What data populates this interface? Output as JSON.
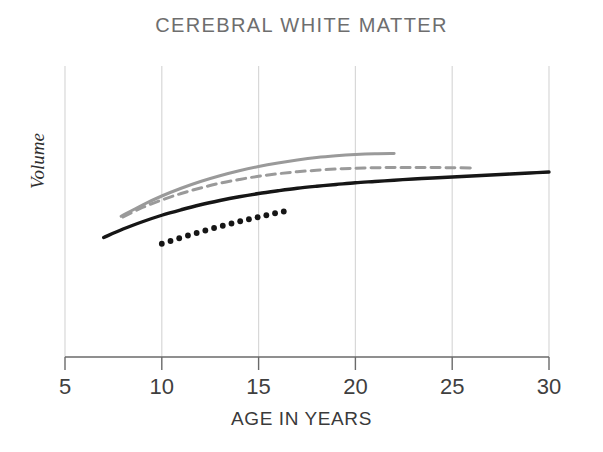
{
  "chart_data": {
    "type": "line",
    "title": "CEREBRAL WHITE MATTER",
    "xlabel": "AGE IN YEARS",
    "ylabel": "Volume",
    "xlim": [
      5,
      30
    ],
    "xticks": [
      5,
      10,
      15,
      20,
      25,
      30
    ],
    "xticklabels": [
      "5",
      "10",
      "15",
      "20",
      "25",
      "30"
    ],
    "ylim": [
      0,
      1
    ],
    "yticks": [],
    "yticklabels": [],
    "grid": "vertical-only",
    "legend": "none",
    "colors": {
      "gray_series": "#9a9a9a",
      "black_series": "#161616",
      "grid": "#d8d8d8",
      "axis": "#6a6a6a",
      "title": "#6e6e6e"
    },
    "series": [
      {
        "name": "gray-solid",
        "style": "solid",
        "color": "#9a9a9a",
        "x": [
          7.9,
          9.0,
          10.0,
          11.0,
          12.0,
          13.0,
          14.0,
          15.0,
          16.0,
          17.0,
          18.0,
          19.0,
          20.0,
          21.0,
          22.0
        ],
        "y": [
          0.455,
          0.5,
          0.536,
          0.567,
          0.594,
          0.617,
          0.637,
          0.654,
          0.668,
          0.68,
          0.69,
          0.697,
          0.702,
          0.705,
          0.706
        ]
      },
      {
        "name": "gray-dashed",
        "style": "dashed",
        "color": "#9a9a9a",
        "x": [
          8.0,
          9.0,
          10.0,
          11.0,
          12.0,
          13.0,
          14.0,
          15.0,
          16.0,
          17.0,
          18.0,
          19.0,
          20.0,
          21.0,
          22.0,
          23.0,
          24.0,
          25.0,
          26.0
        ],
        "y": [
          0.452,
          0.49,
          0.52,
          0.546,
          0.568,
          0.587,
          0.602,
          0.615,
          0.625,
          0.633,
          0.639,
          0.644,
          0.647,
          0.649,
          0.65,
          0.65,
          0.65,
          0.649,
          0.648
        ]
      },
      {
        "name": "black-solid",
        "style": "solid",
        "color": "#161616",
        "x": [
          7.0,
          8.0,
          9.0,
          10.0,
          11.0,
          12.0,
          13.0,
          14.0,
          15.0,
          16.0,
          17.0,
          18.0,
          19.0,
          20.0,
          21.0,
          22.0,
          23.0,
          24.0,
          25.0,
          26.0,
          27.0,
          28.0,
          29.0,
          30.0
        ],
        "y": [
          0.37,
          0.404,
          0.433,
          0.459,
          0.481,
          0.501,
          0.518,
          0.533,
          0.546,
          0.557,
          0.567,
          0.575,
          0.582,
          0.589,
          0.594,
          0.599,
          0.604,
          0.608,
          0.612,
          0.616,
          0.62,
          0.624,
          0.628,
          0.632
        ]
      },
      {
        "name": "black-dotted",
        "style": "dotted",
        "color": "#161616",
        "x": [
          10.0,
          10.45,
          10.9,
          11.35,
          11.8,
          12.25,
          12.7,
          13.15,
          13.6,
          14.05,
          14.5,
          14.95,
          15.4,
          15.85,
          16.3
        ],
        "y": [
          0.345,
          0.356,
          0.367,
          0.378,
          0.388,
          0.398,
          0.408,
          0.417,
          0.426,
          0.435,
          0.443,
          0.451,
          0.459,
          0.467,
          0.474
        ]
      }
    ]
  }
}
